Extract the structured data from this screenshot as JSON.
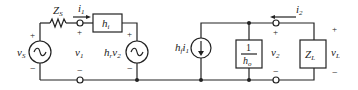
{
  "diagram": {
    "type": "h-parameter equivalent circuit (two-port)",
    "colors": {
      "line": "#222222",
      "background": "#ffffff"
    },
    "components": {
      "source_voltage": {
        "label": "v",
        "sub": "S",
        "icon": "ac-voltage-source-icon",
        "plus": "+",
        "minus": "−"
      },
      "source_impedance": {
        "label": "Z",
        "sub": "S",
        "icon": "resistor-icon"
      },
      "input_current": {
        "label": "i",
        "sub": "1"
      },
      "input_voltage": {
        "label": "v",
        "sub": "1",
        "plus": "+",
        "minus": "−"
      },
      "hi_box": {
        "label": "h",
        "sub": "i"
      },
      "reverse_source": {
        "label": "h",
        "sub": "r",
        "label2": "v",
        "sub2": "2",
        "icon": "ac-voltage-source-icon",
        "plus": "+",
        "minus": "−"
      },
      "forward_source": {
        "label": "h",
        "sub": "f",
        "label2": "i",
        "sub2": "1",
        "icon": "dependent-current-source-icon"
      },
      "ho_box": {
        "numerator": "1",
        "label": "h",
        "sub": "o"
      },
      "output_current": {
        "label": "i",
        "sub": "2"
      },
      "output_voltage": {
        "label": "v",
        "sub": "2",
        "plus": "+",
        "minus": "−"
      },
      "load": {
        "label": "Z",
        "sub": "L"
      },
      "load_voltage": {
        "label": "v",
        "sub": "L",
        "plus": "+",
        "minus": "−"
      }
    }
  }
}
